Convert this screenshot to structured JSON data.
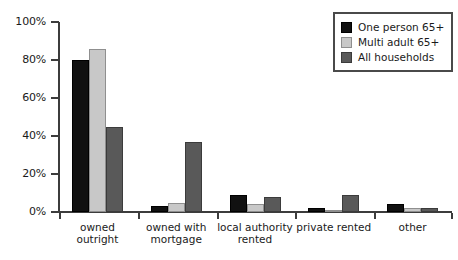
{
  "chart_data": {
    "type": "bar",
    "title": "",
    "subtitle": "",
    "xlabel": "",
    "ylabel": "",
    "ylim": [
      0,
      100
    ],
    "ytick_labels": [
      "0%",
      "20%",
      "40%",
      "60%",
      "80%",
      "100%"
    ],
    "ytick_values": [
      0,
      20,
      40,
      60,
      80,
      100
    ],
    "grid": false,
    "legend_position": "top-right",
    "categories": [
      "owned outright",
      "owned with\nmortgage",
      "local authority\nrented",
      "private rented",
      "other"
    ],
    "series": [
      {
        "name": "One person 65+",
        "color": "#111111",
        "values": [
          80,
          3,
          9,
          2,
          4
        ]
      },
      {
        "name": "Multi adult 65+",
        "color": "#c8c8c8",
        "values": [
          86,
          5,
          4,
          1,
          2
        ]
      },
      {
        "name": "All households",
        "color": "#595959",
        "values": [
          45,
          37,
          8,
          9,
          2
        ]
      }
    ]
  },
  "legend": {
    "items": [
      {
        "label": "One person 65+"
      },
      {
        "label": "Multi adult 65+"
      },
      {
        "label": "All households"
      }
    ]
  },
  "colors": {
    "series_one_person": "#111111",
    "series_multi_adult": "#c8c8c8",
    "series_all_households": "#595959",
    "axis": "#3c3c3c",
    "text": "#1a1a1a",
    "background": "#ffffff",
    "legend_border": "#4a4a4a"
  }
}
